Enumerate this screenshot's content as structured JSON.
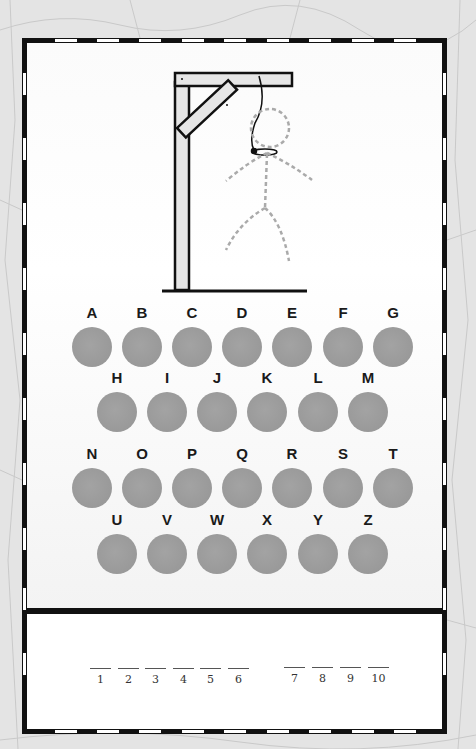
{
  "game": {
    "title": "Hangman",
    "wrong_guesses": 0,
    "colors": {
      "frame": "#111111",
      "button": "#9c9c9c",
      "figure_dotted": "#aaaaaa",
      "gallows_fill": "#e6e6e6"
    }
  },
  "letters": {
    "row1": [
      "A",
      "B",
      "C",
      "D",
      "E",
      "F",
      "G"
    ],
    "row2": [
      "H",
      "I",
      "J",
      "K",
      "L",
      "M"
    ],
    "row3": [
      "N",
      "O",
      "P",
      "Q",
      "R",
      "S",
      "T"
    ],
    "row4": [
      "U",
      "V",
      "W",
      "X",
      "Y",
      "Z"
    ]
  },
  "answer": {
    "word1_slots": [
      "1",
      "2",
      "3",
      "4",
      "5",
      "6"
    ],
    "word2_slots": [
      "7",
      "8",
      "9",
      "10"
    ]
  }
}
